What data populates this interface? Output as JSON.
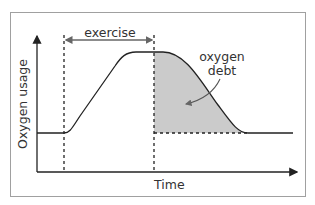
{
  "diagram": {
    "title": "",
    "y_axis_label": "Oxygen usage",
    "x_axis_label": "Time",
    "exercise_label": "exercise",
    "debt_label_line1": "oxygen",
    "debt_label_line2": "debt",
    "colors": {
      "line": "#222222",
      "shade": "#c8c8c8",
      "frame": "#9a9a9a",
      "arrow": "#666666"
    }
  }
}
